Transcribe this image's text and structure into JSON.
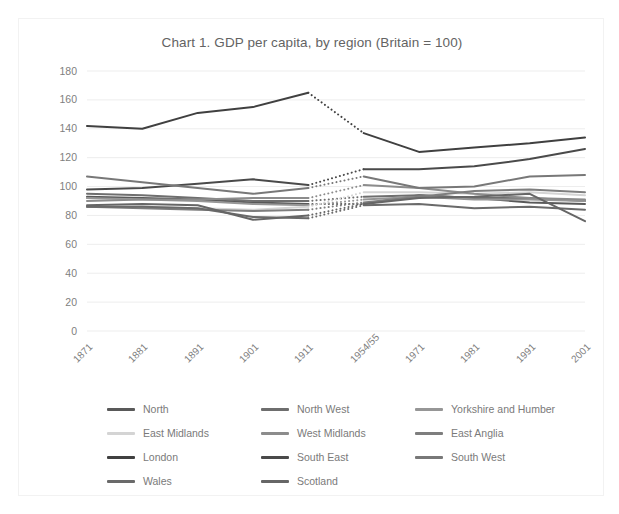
{
  "card": {
    "title": "Chart 1. GDP per capita, by region (Britain = 100)"
  },
  "chart_data": {
    "type": "line",
    "title": "Chart 1. GDP per capita, by region (Britain = 100)",
    "xlabel": "",
    "ylabel": "",
    "ylim": [
      0,
      180
    ],
    "ytick_step": 20,
    "yticks": [
      "0",
      "20",
      "40",
      "60",
      "80",
      "100",
      "120",
      "140",
      "160",
      "180"
    ],
    "grid": "horizontal",
    "legend_position": "bottom",
    "gap_between_index": [
      4,
      5
    ],
    "gap_style": "dotted",
    "categories": [
      "1871",
      "1881",
      "1891",
      "1901",
      "1911",
      "1954/55",
      "1971",
      "1981",
      "1991",
      "2001"
    ],
    "series": [
      {
        "name": "North",
        "color": "#595959",
        "values": [
          93,
          92,
          91,
          89,
          88,
          88,
          94,
          92,
          89,
          88
        ]
      },
      {
        "name": "North West",
        "color": "#6E6E6E",
        "values": [
          95,
          94,
          92,
          90,
          90,
          93,
          94,
          92,
          92,
          90
        ]
      },
      {
        "name": "Yorkshire and Humber",
        "color": "#969696",
        "values": [
          92,
          91,
          90,
          88,
          87,
          91,
          93,
          91,
          91,
          90
        ]
      },
      {
        "name": "East Midlands",
        "color": "#D4D4D4",
        "values": [
          86,
          86,
          85,
          84,
          86,
          96,
          96,
          95,
          96,
          94
        ]
      },
      {
        "name": "West Midlands",
        "color": "#8C8C8C",
        "values": [
          90,
          91,
          91,
          92,
          92,
          101,
          99,
          95,
          92,
          91
        ]
      },
      {
        "name": "East Anglia",
        "color": "#7E7E7E",
        "values": [
          86,
          85,
          84,
          83,
          84,
          89,
          93,
          97,
          98,
          96
        ]
      },
      {
        "name": "London",
        "color": "#404040",
        "values": [
          142,
          140,
          151,
          155,
          165,
          137,
          124,
          127,
          130,
          134
        ]
      },
      {
        "name": "South East",
        "color": "#4A4A4A",
        "values": [
          98,
          99,
          102,
          105,
          101,
          112,
          112,
          114,
          119,
          126
        ]
      },
      {
        "name": "South West",
        "color": "#787878",
        "values": [
          107,
          103,
          99,
          95,
          99,
          107,
          99,
          100,
          107,
          108
        ]
      },
      {
        "name": "Wales",
        "color": "#6A6A6A",
        "values": [
          86,
          86,
          85,
          79,
          78,
          87,
          88,
          85,
          86,
          84
        ]
      },
      {
        "name": "Scotland",
        "color": "#666666",
        "values": [
          87,
          88,
          87,
          77,
          80,
          88,
          92,
          93,
          95,
          76
        ]
      }
    ]
  }
}
